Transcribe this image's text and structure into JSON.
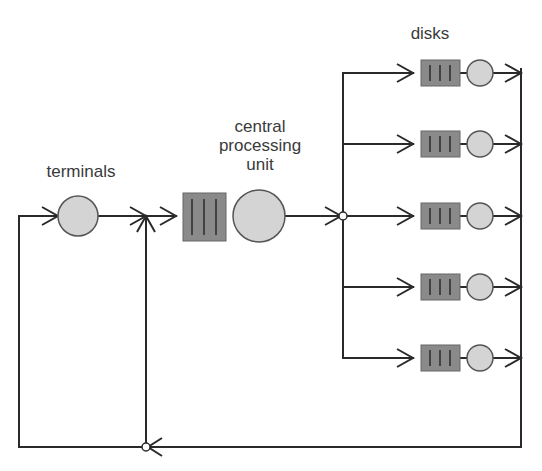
{
  "labels": {
    "terminals": "terminals",
    "cpu_line1": "central",
    "cpu_line2": "processing",
    "cpu_line3": "unit",
    "disks": "disks"
  },
  "colors": {
    "line": "#2a2a2a",
    "queue_fill": "#8a8a8a",
    "server_fill": "#d4d4d4",
    "text": "#3a3a3a"
  },
  "diagram": {
    "type": "closed queueing network",
    "nodes": [
      {
        "id": "terminals",
        "kind": "server",
        "label": "terminals"
      },
      {
        "id": "cpu",
        "kind": "queue+server",
        "label": "central processing unit"
      },
      {
        "id": "disk1",
        "kind": "queue+server",
        "label": "disks"
      },
      {
        "id": "disk2",
        "kind": "queue+server",
        "label": "disks"
      },
      {
        "id": "disk3",
        "kind": "queue+server",
        "label": "disks"
      },
      {
        "id": "disk4",
        "kind": "queue+server",
        "label": "disks"
      },
      {
        "id": "disk5",
        "kind": "queue+server",
        "label": "disks"
      }
    ],
    "edges": [
      [
        "terminals",
        "cpu"
      ],
      [
        "cpu",
        "disk1"
      ],
      [
        "cpu",
        "disk2"
      ],
      [
        "cpu",
        "disk3"
      ],
      [
        "cpu",
        "disk4"
      ],
      [
        "cpu",
        "disk5"
      ],
      [
        "disk1",
        "return"
      ],
      [
        "disk2",
        "return"
      ],
      [
        "disk3",
        "return"
      ],
      [
        "disk4",
        "return"
      ],
      [
        "disk5",
        "return"
      ],
      [
        "return",
        "terminals"
      ],
      [
        "return",
        "cpu"
      ]
    ]
  }
}
